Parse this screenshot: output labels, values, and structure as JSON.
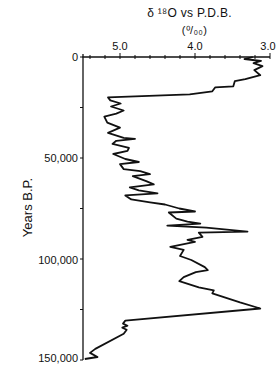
{
  "chart_data": {
    "type": "line",
    "subtitle": "(‰)",
    "title_main": "δ ¹⁸O  vs P.D.B.",
    "subtitle_text": "(⁰/₀₀)",
    "xlabel": "δ18O vs P.D.B. (per mil)",
    "ylabel": "Years B.P.",
    "x_axis_position": "top",
    "x_reversed": true,
    "y_reversed": true,
    "xlim": [
      5.5,
      3.0
    ],
    "ylim": [
      0,
      150000
    ],
    "x_ticks": [
      "5.0",
      "4.0",
      "3.0"
    ],
    "y_ticks": [
      "0",
      "50,000",
      "100,000",
      "150,000"
    ],
    "grid": false,
    "series": [
      {
        "name": "δ18O",
        "points": [
          [
            3.23,
            0
          ],
          [
            3.34,
            1000
          ],
          [
            3.12,
            2000
          ],
          [
            3.22,
            3000
          ],
          [
            3.1,
            4500
          ],
          [
            3.21,
            6500
          ],
          [
            3.13,
            9000
          ],
          [
            3.33,
            11000
          ],
          [
            3.47,
            12000
          ],
          [
            3.49,
            14500
          ],
          [
            3.73,
            15000
          ],
          [
            3.77,
            17000
          ],
          [
            4.07,
            18500
          ],
          [
            5.16,
            20000
          ],
          [
            5.13,
            21500
          ],
          [
            4.99,
            23000
          ],
          [
            5.12,
            24500
          ],
          [
            4.95,
            26500
          ],
          [
            5.05,
            28000
          ],
          [
            5.21,
            29500
          ],
          [
            5.17,
            32500
          ],
          [
            5.0,
            35000
          ],
          [
            5.16,
            37500
          ],
          [
            4.95,
            40000
          ],
          [
            4.8,
            40500
          ],
          [
            5.05,
            41500
          ],
          [
            5.1,
            43000
          ],
          [
            4.88,
            45000
          ],
          [
            4.9,
            46500
          ],
          [
            5.09,
            48000
          ],
          [
            4.93,
            50500
          ],
          [
            4.75,
            52000
          ],
          [
            5.0,
            53000
          ],
          [
            4.95,
            55500
          ],
          [
            4.73,
            56500
          ],
          [
            4.6,
            58000
          ],
          [
            4.83,
            59000
          ],
          [
            4.65,
            61500
          ],
          [
            4.55,
            63000
          ],
          [
            4.87,
            64500
          ],
          [
            4.75,
            66000
          ],
          [
            4.5,
            67500
          ],
          [
            4.93,
            68500
          ],
          [
            4.85,
            70500
          ],
          [
            4.6,
            72000
          ],
          [
            4.4,
            73000
          ],
          [
            4.21,
            75000
          ],
          [
            4.0,
            76500
          ],
          [
            4.35,
            77000
          ],
          [
            4.25,
            80000
          ],
          [
            4.1,
            81500
          ],
          [
            3.93,
            82500
          ],
          [
            4.37,
            83500
          ],
          [
            3.85,
            84500
          ],
          [
            3.3,
            86500
          ],
          [
            3.95,
            87000
          ],
          [
            3.9,
            89000
          ],
          [
            4.1,
            90500
          ],
          [
            4.0,
            91500
          ],
          [
            4.33,
            94000
          ],
          [
            4.15,
            95500
          ],
          [
            4.2,
            98500
          ],
          [
            4.05,
            100500
          ],
          [
            3.87,
            104000
          ],
          [
            3.83,
            105500
          ],
          [
            3.99,
            106500
          ],
          [
            4.15,
            109000
          ],
          [
            4.21,
            111000
          ],
          [
            3.95,
            114000
          ],
          [
            3.75,
            115500
          ],
          [
            3.77,
            117000
          ],
          [
            3.4,
            121500
          ],
          [
            3.13,
            124500
          ],
          [
            4.93,
            130500
          ],
          [
            4.96,
            132000
          ],
          [
            4.9,
            133000
          ],
          [
            4.97,
            134000
          ],
          [
            4.91,
            135000
          ],
          [
            4.95,
            137000
          ],
          [
            5.33,
            144500
          ],
          [
            5.4,
            146500
          ],
          [
            5.3,
            148500
          ],
          [
            5.47,
            149500
          ]
        ]
      }
    ]
  }
}
